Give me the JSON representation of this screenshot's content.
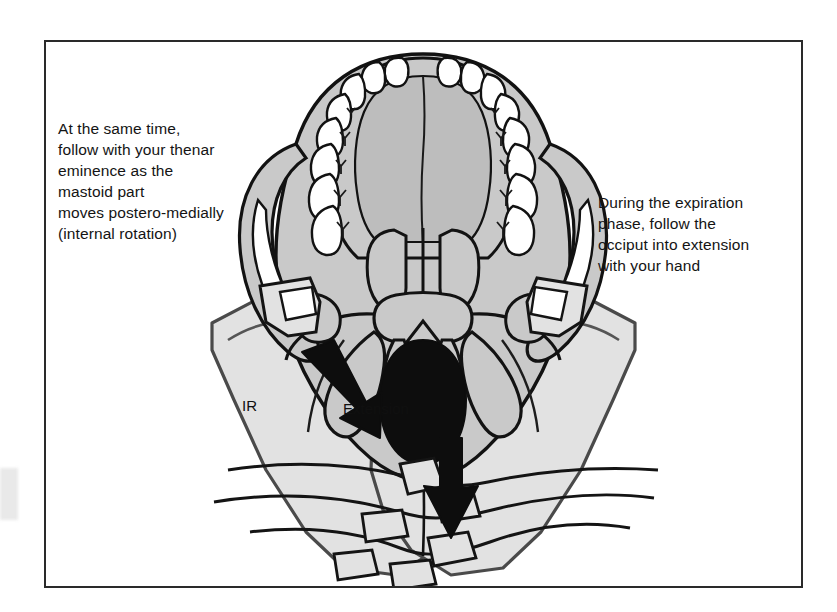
{
  "figure": {
    "border_color": "#2a2a2a",
    "background_color": "#ffffff"
  },
  "captions": {
    "left": {
      "name": "internal-rotation-instruction",
      "text": "At the same time,\nfollow with your thenar\neminence as the\nmastoid part\nmoves postero-medially\n(internal rotation)"
    },
    "right": {
      "name": "expiration-instruction",
      "text": "During the expiration\nphase, follow the\nocciput into extension\nwith your hand"
    }
  },
  "annotations": {
    "ir_label": "IR",
    "extension_label": "Extension"
  },
  "anatomy": {
    "skull_fill": "#c9c9c9",
    "skull_outline": "#121212",
    "tooth_fill": "#ffffff",
    "foramen_magnum_fill": "#0d0d0d",
    "palate_fill": "#bdbdbd",
    "hand_fill": "#e2e2e2",
    "hand_outline": "#4a4a4a",
    "arrow_fill": "#0d0d0d",
    "teeth_count_per_side": 8,
    "structures": [
      "maxillary dental arch",
      "hard palate",
      "vomer",
      "zygomatic arch",
      "mandibular fossa",
      "styloid process",
      "mastoid process",
      "occipital condyle",
      "foramen magnum",
      "occipital squama",
      "median nuchal line"
    ]
  },
  "arrows": {
    "internal_rotation": {
      "name": "internal-rotation-arrow",
      "direction": "down-right",
      "label": "IR"
    },
    "extension": {
      "name": "extension-arrow",
      "direction": "down",
      "label": "Extension"
    }
  }
}
